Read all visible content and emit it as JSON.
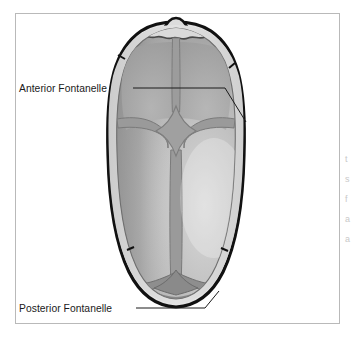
{
  "figure": {
    "view": "superior (top-down) view of neonatal skull",
    "background_color": "#ffffff",
    "frame": {
      "name": "figure-border",
      "stroke_color": "#b9b9b9",
      "x": 15,
      "y": 13,
      "width": 325,
      "height": 311
    }
  },
  "labels": [
    {
      "id": "anterior",
      "text": "Anterior Fontanelle",
      "text_x": 19,
      "text_y": 92,
      "leader_points": "133,88 225,88 246,122",
      "target": "anterior fontanelle suture junction"
    },
    {
      "id": "posterior",
      "text": "Posterior Fontanelle",
      "text_x": 19,
      "text_y": 312,
      "leader_points": "136,308 205,308 219,291",
      "target": "posterior fontanelle suture junction"
    }
  ],
  "anatomy": {
    "outline_color": "#111111",
    "rim_color": "#d6d6d6",
    "bone_base_color": "#a8a8a8",
    "bone_light_color": "#d2d2d2",
    "bone_dark_color": "#8e8e8e",
    "suture_color": "#8a8a8a",
    "suture_dark_color": "#7a7a7a",
    "parts": [
      {
        "name": "frontal-bone-left",
        "label": "Left frontal bone"
      },
      {
        "name": "frontal-bone-right",
        "label": "Right frontal bone"
      },
      {
        "name": "parietal-bone-left",
        "label": "Left parietal bone"
      },
      {
        "name": "parietal-bone-right",
        "label": "Right parietal bone"
      },
      {
        "name": "occipital-bone",
        "label": "Occipital bone"
      },
      {
        "name": "sagittal-suture",
        "label": "Sagittal suture"
      },
      {
        "name": "coronal-suture",
        "label": "Coronal suture"
      },
      {
        "name": "lambdoid-suture",
        "label": "Lambdoid suture"
      },
      {
        "name": "anterior-fontanelle",
        "label": "Anterior fontanelle"
      },
      {
        "name": "posterior-fontanelle",
        "label": "Posterior fontanelle"
      }
    ]
  },
  "margin_fragments": [
    {
      "text": "t",
      "x": 345,
      "y": 162
    },
    {
      "text": "s",
      "x": 345,
      "y": 182
    },
    {
      "text": "f",
      "x": 345,
      "y": 202
    },
    {
      "text": "a",
      "x": 345,
      "y": 222
    },
    {
      "text": "a",
      "x": 345,
      "y": 242
    }
  ]
}
